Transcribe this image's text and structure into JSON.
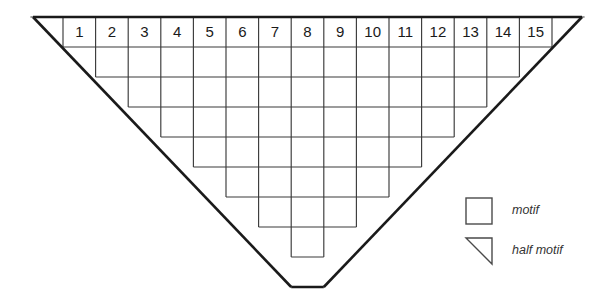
{
  "figure": {
    "type": "grid-diagram",
    "rows": 8,
    "top_row_cells": 15,
    "bottom_row_cells": 1,
    "cell_width": 32.6,
    "cell_height": 30,
    "origin": {
      "x": 63,
      "y": 17
    },
    "apex": {
      "x": 307.5,
      "y": 257
    },
    "top_left_vertex": {
      "x": 33,
      "y": 17
    },
    "top_right_vertex": {
      "x": 582,
      "y": 17
    },
    "colors": {
      "background": "#ffffff",
      "outline": "#1a1a1a",
      "grid": "#3a3a3a",
      "number_text": "#1a1a1a",
      "legend_text": "#333333",
      "legend_shape_stroke": "#4a4a4a"
    },
    "column_numbers": [
      "1",
      "2",
      "3",
      "4",
      "5",
      "6",
      "7",
      "8",
      "9",
      "10",
      "11",
      "12",
      "13",
      "14",
      "15"
    ],
    "row_cell_counts": [
      15,
      13,
      11,
      9,
      7,
      5,
      3,
      1
    ],
    "row_left_offsets": [
      0,
      1,
      2,
      3,
      4,
      5,
      6,
      7
    ],
    "half_motifs_per_row": 2,
    "half_motif_total": 16,
    "motif_total": 64
  },
  "legend": {
    "items": [
      {
        "shape": "square",
        "label": "motif"
      },
      {
        "shape": "triangle",
        "label": "half motif"
      }
    ],
    "square": {
      "x": 466,
      "y": 198,
      "size": 26
    },
    "triangle": {
      "x": 466,
      "y": 238,
      "size": 26
    },
    "label_x": 512,
    "square_label_y": 211,
    "triangle_label_y": 251
  }
}
